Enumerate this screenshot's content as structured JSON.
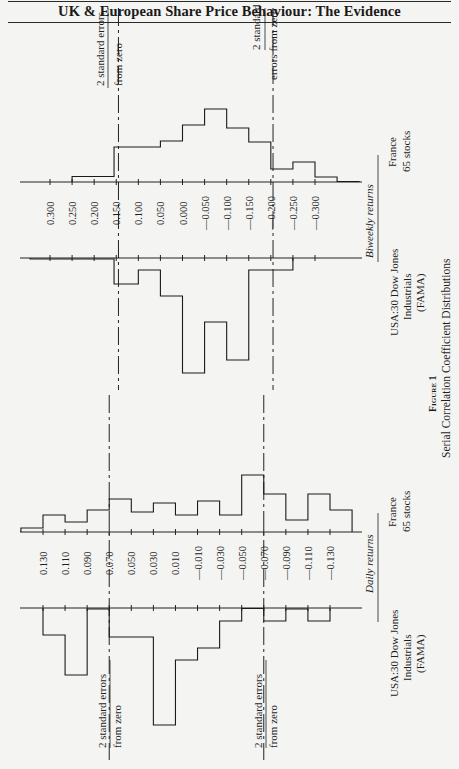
{
  "header": {
    "title": "UK & European Share Price Behaviour: The Evidence"
  },
  "figure": {
    "label": "Figure 1",
    "caption": "Serial Correlation Coefficient Distributions"
  },
  "annotations": {
    "se_line1": "2 standard errors",
    "se_line2": "from zero",
    "se_right_line1": "2 standard",
    "se_right_line2": "errors from zero"
  },
  "panels": {
    "biweekly": {
      "title": "Biweekly returns",
      "france_label_1": "France",
      "france_label_2": "65 stocks",
      "usa_label_1": "USA:30 Dow Jones",
      "usa_label_2": "Industrials",
      "usa_label_3": "(FAMA)"
    },
    "daily": {
      "title": "Daily returns",
      "france_label_1": "France",
      "france_label_2": "65 stocks",
      "usa_label_1": "USA:30 Dow Jones",
      "usa_label_2": "Industrials",
      "usa_label_3": "(FAMA)"
    }
  },
  "chart_data": [
    {
      "type": "bar",
      "title": "Serial Correlation Coefficient Distributions — Biweekly returns",
      "xlabel": "Serial correlation coefficient",
      "ylabel": "Relative frequency (unlabelled)",
      "tick_labels": [
        "0.300",
        "0.250",
        "0.200",
        "0.150",
        "0.100",
        "0.050",
        "0.000",
        "-0.050",
        "-0.100",
        "-0.150",
        "-0.200",
        "-0.250",
        "-0.300"
      ],
      "two_se_bounds": [
        0.145,
        -0.205
      ],
      "series": [
        {
          "name": "France 65 stocks",
          "direction": "up",
          "bins": [
            [
              0.25,
              0.155,
              5.5
            ],
            [
              0.155,
              0.05,
              35
            ],
            [
              0.05,
              0.0,
              41
            ],
            [
              0.0,
              -0.05,
              57
            ],
            [
              -0.05,
              -0.1,
              73
            ],
            [
              -0.1,
              -0.15,
              54
            ],
            [
              -0.15,
              -0.2,
              40
            ],
            [
              -0.2,
              -0.25,
              13
            ],
            [
              -0.25,
              -0.3,
              20
            ],
            [
              -0.3,
              -0.35,
              5
            ],
            [
              -0.35,
              -0.4,
              0.5
            ]
          ]
        },
        {
          "name": "USA:30 Dow Jones Industrials (FAMA)",
          "direction": "down",
          "bins": [
            [
              0.345,
              0.155,
              1
            ],
            [
              0.155,
              0.1,
              26
            ],
            [
              0.1,
              0.05,
              12
            ],
            [
              0.05,
              0.0,
              38
            ],
            [
              0.0,
              -0.05,
              115
            ],
            [
              -0.05,
              -0.1,
              64
            ],
            [
              -0.1,
              -0.15,
              102
            ],
            [
              -0.15,
              -0.25,
              12
            ]
          ]
        }
      ]
    },
    {
      "type": "bar",
      "title": "Serial Correlation Coefficient Distributions — Daily returns",
      "xlabel": "Serial correlation coefficient",
      "ylabel": "Relative frequency (unlabelled)",
      "tick_labels": [
        "0.130",
        "0.110",
        "0.090",
        "0.070",
        "0.050",
        "0.030",
        "0.010",
        "-0.010",
        "-0.030",
        "-0.050",
        "-0.070",
        "-0.090",
        "-0.110",
        "-0.130"
      ],
      "two_se_bounds": [
        0.07,
        -0.07
      ],
      "series": [
        {
          "name": "France 65 stocks",
          "direction": "up",
          "bins": [
            [
              0.15,
              0.13,
              4
            ],
            [
              0.13,
              0.11,
              17
            ],
            [
              0.11,
              0.09,
              10
            ],
            [
              0.09,
              0.07,
              22
            ],
            [
              0.07,
              0.05,
              33
            ],
            [
              0.05,
              0.03,
              20
            ],
            [
              0.03,
              0.01,
              29
            ],
            [
              0.01,
              -0.01,
              17
            ],
            [
              -0.01,
              -0.03,
              31
            ],
            [
              -0.03,
              -0.05,
              17
            ],
            [
              -0.05,
              -0.07,
              57
            ],
            [
              -0.07,
              -0.09,
              38
            ],
            [
              -0.09,
              -0.11,
              12
            ],
            [
              -0.11,
              -0.13,
              38
            ],
            [
              -0.13,
              -0.15,
              22
            ]
          ]
        },
        {
          "name": "USA:30 Dow Jones Industrials (FAMA)",
          "direction": "down",
          "bins": [
            [
              0.13,
              0.11,
              27
            ],
            [
              0.11,
              0.09,
              67
            ],
            [
              0.09,
              0.07,
              1
            ],
            [
              0.07,
              0.03,
              29
            ],
            [
              0.03,
              0.01,
              117
            ],
            [
              0.01,
              -0.01,
              52
            ],
            [
              -0.01,
              -0.03,
              40
            ],
            [
              -0.03,
              -0.05,
              13
            ],
            [
              -0.05,
              -0.07,
              0.5
            ],
            [
              -0.07,
              -0.09,
              13
            ],
            [
              -0.09,
              -0.11,
              1
            ],
            [
              -0.11,
              -0.13,
              13
            ]
          ]
        }
      ]
    }
  ]
}
